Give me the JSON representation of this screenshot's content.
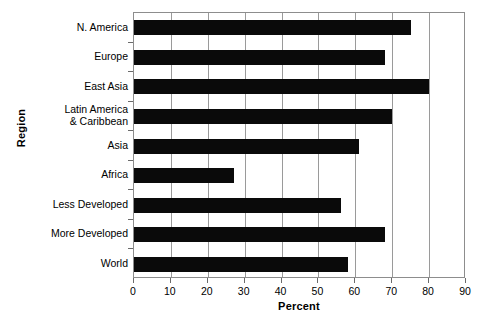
{
  "chart_data": {
    "type": "bar",
    "orientation": "horizontal",
    "title": "",
    "xlabel": "Percent",
    "ylabel": "Region",
    "categories": [
      "N. America",
      "Europe",
      "East Asia",
      "Latin America\n& Caribbean",
      "Asia",
      "Africa",
      "Less Developed",
      "More Developed",
      "World"
    ],
    "values": [
      75,
      68,
      80,
      70,
      61,
      27,
      56,
      68,
      58
    ],
    "xlim": [
      0,
      90
    ],
    "xticks": [
      0,
      10,
      20,
      30,
      40,
      50,
      60,
      70,
      80,
      90
    ],
    "xtick_labels": [
      "0",
      "10",
      "20",
      "30",
      "40",
      "50",
      "60",
      "70",
      "80",
      "90"
    ],
    "grid": "vertical",
    "legend": "none",
    "bar_color": "#0a0a0a",
    "grid_color": "#9a9a9a",
    "frame_color": "#8d8d8d",
    "background": "#ffffff"
  }
}
